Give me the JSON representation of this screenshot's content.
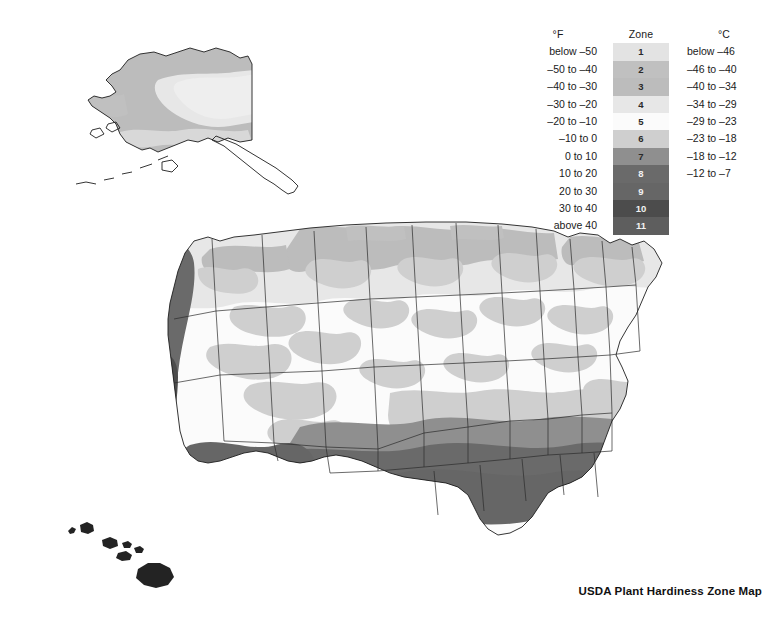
{
  "title": "USDA Plant Hardiness Zone Map",
  "legend": {
    "header_f": "°F",
    "header_zone": "Zone",
    "header_c": "°C",
    "rows": [
      {
        "zone": "1",
        "f": "below –50",
        "c": "below –46",
        "color": "#e3e3e3"
      },
      {
        "zone": "2",
        "f": "–50 to –40",
        "c": "–46 to –40",
        "color": "#c0c0c0"
      },
      {
        "zone": "3",
        "f": "–40 to –30",
        "c": "–40 to –34",
        "color": "#bcbcbc"
      },
      {
        "zone": "4",
        "f": "–30 to –20",
        "c": "–34 to –29",
        "color": "#e7e7e7"
      },
      {
        "zone": "5",
        "f": "–20 to –10",
        "c": "–29 to –23",
        "color": "#fbfbfb"
      },
      {
        "zone": "6",
        "f": "–10 to 0",
        "c": "–23 to –18",
        "color": "#cfcfcf"
      },
      {
        "zone": "7",
        "f": "0 to 10",
        "c": "–18 to –12",
        "color": "#8f8f8f"
      },
      {
        "zone": "8",
        "f": "10 to 20",
        "c": "–12 to –7",
        "color": "#6a6a6a"
      },
      {
        "zone": "9",
        "f": "20 to 30",
        "c": "",
        "color": "#666666"
      },
      {
        "zone": "10",
        "f": "30 to 40",
        "c": "",
        "color": "#4c4c4c"
      },
      {
        "zone": "11",
        "f": "above 40",
        "c": "",
        "color": "#5e5e5e"
      }
    ]
  },
  "maps": {
    "conus_name": "contiguous-united-states",
    "alaska_name": "alaska-inset",
    "hawaii_name": "hawaii-inset"
  },
  "chart_data": {
    "type": "map",
    "title": "USDA Plant Hardiness Zone Map",
    "legend_position": "top-right",
    "zone_count": 11,
    "zones": [
      {
        "zone": 1,
        "f_range": "below -50",
        "c_range": "below -46",
        "f_min": null,
        "f_max": -50,
        "c_min": null,
        "c_max": -46,
        "color": "#e3e3e3"
      },
      {
        "zone": 2,
        "f_range": "-50 to -40",
        "c_range": "-46 to -40",
        "f_min": -50,
        "f_max": -40,
        "c_min": -46,
        "c_max": -40,
        "color": "#c0c0c0"
      },
      {
        "zone": 3,
        "f_range": "-40 to -30",
        "c_range": "-40 to -34",
        "f_min": -40,
        "f_max": -30,
        "c_min": -40,
        "c_max": -34,
        "color": "#bcbcbc"
      },
      {
        "zone": 4,
        "f_range": "-30 to -20",
        "c_range": "-34 to -29",
        "f_min": -30,
        "f_max": -20,
        "c_min": -34,
        "c_max": -29,
        "color": "#e7e7e7"
      },
      {
        "zone": 5,
        "f_range": "-20 to -10",
        "c_range": "-29 to -23",
        "f_min": -20,
        "f_max": -10,
        "c_min": -29,
        "c_max": -23,
        "color": "#fbfbfb"
      },
      {
        "zone": 6,
        "f_range": "-10 to 0",
        "c_range": "-23 to -18",
        "f_min": -10,
        "f_max": 0,
        "c_min": -23,
        "c_max": -18,
        "color": "#cfcfcf"
      },
      {
        "zone": 7,
        "f_range": "0 to 10",
        "c_range": "-18 to -12",
        "f_min": 0,
        "f_max": 10,
        "c_min": -18,
        "c_max": -12,
        "color": "#8f8f8f"
      },
      {
        "zone": 8,
        "f_range": "10 to 20",
        "c_range": "-12 to -7",
        "f_min": 10,
        "f_max": 20,
        "c_min": -12,
        "c_max": -7,
        "color": "#6a6a6a"
      },
      {
        "zone": 9,
        "f_range": "20 to 30",
        "c_range": "",
        "f_min": 20,
        "f_max": 30,
        "c_min": null,
        "c_max": null,
        "color": "#666666"
      },
      {
        "zone": 10,
        "f_range": "30 to 40",
        "c_range": "",
        "f_min": 30,
        "f_max": 40,
        "c_min": null,
        "c_max": null,
        "color": "#4c4c4c"
      },
      {
        "zone": 11,
        "f_range": "above 40",
        "c_range": "",
        "f_min": 40,
        "f_max": null,
        "c_min": null,
        "c_max": null,
        "color": "#5e5e5e"
      }
    ],
    "regions": [
      {
        "name": "Alaska interior",
        "zones": [
          1,
          2,
          3
        ]
      },
      {
        "name": "Alaska south coast",
        "zones": [
          4,
          5
        ]
      },
      {
        "name": "Northern Plains",
        "zones": [
          3,
          4
        ]
      },
      {
        "name": "Upper Midwest",
        "zones": [
          3,
          4,
          5
        ]
      },
      {
        "name": "Mountain West",
        "zones": [
          4,
          5,
          6
        ]
      },
      {
        "name": "Pacific Northwest coast",
        "zones": [
          8
        ]
      },
      {
        "name": "California coast",
        "zones": [
          9,
          10
        ]
      },
      {
        "name": "Desert Southwest",
        "zones": [
          8,
          9
        ]
      },
      {
        "name": "Northeast",
        "zones": [
          4,
          5,
          6
        ]
      },
      {
        "name": "Mid-Atlantic",
        "zones": [
          6,
          7
        ]
      },
      {
        "name": "Southeast",
        "zones": [
          7,
          8
        ]
      },
      {
        "name": "Gulf Coast",
        "zones": [
          8,
          9
        ]
      },
      {
        "name": "South Florida",
        "zones": [
          10,
          11
        ]
      },
      {
        "name": "Hawaii",
        "zones": [
          11
        ]
      }
    ]
  }
}
